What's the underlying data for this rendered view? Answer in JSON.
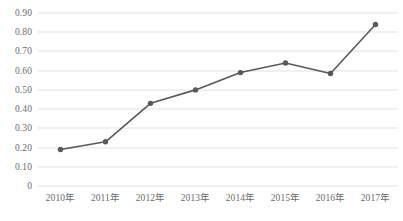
{
  "chart_data": {
    "type": "line",
    "title": "",
    "subtitle": "",
    "xlabel": "",
    "ylabel": "",
    "categories": [
      "2010年",
      "2011年",
      "2012年",
      "2013年",
      "2014年",
      "2015年",
      "2016年",
      "2017年"
    ],
    "values": [
      0.19,
      0.23,
      0.43,
      0.5,
      0.59,
      0.64,
      0.585,
      0.84
    ],
    "series": [
      {
        "name": "",
        "values": [
          0.19,
          0.23,
          0.43,
          0.5,
          0.59,
          0.64,
          0.585,
          0.84
        ]
      }
    ],
    "ylim": [
      0,
      0.9
    ],
    "ytick_labels": [
      "0.90",
      "0.80",
      "0.70",
      "0.60",
      "0.50",
      "0.40",
      "0.30",
      "0.20",
      "0.10",
      "0"
    ],
    "ytick_values": [
      0.9,
      0.8,
      0.7,
      0.6,
      0.5,
      0.4,
      0.3,
      0.2,
      0.1,
      0
    ],
    "grid": true,
    "grid_axis": "y",
    "legend": false,
    "legend_position": "none",
    "annotations": [],
    "markers": true,
    "colors": {
      "line": "#595959",
      "marker": "#595959",
      "grid": "#e2e2e4",
      "text": "#6b6b6b",
      "background": "#ffffff"
    }
  }
}
